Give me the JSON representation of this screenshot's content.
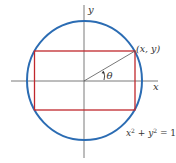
{
  "figure": {
    "labels": {
      "y_axis": "y",
      "x_axis": "x",
      "point": "(x, y)",
      "angle": "θ",
      "equation_lhs_x": "x",
      "equation_sup1": "2",
      "equation_plus": " + ",
      "equation_lhs_y": "y",
      "equation_sup2": "2",
      "equation_rhs": " = 1"
    },
    "colors": {
      "circle": "#2b6cb3",
      "rectangle": "#c0282d",
      "axes": "#6b6b6b",
      "radius": "#555555"
    },
    "geometry": {
      "center": [
        84,
        81
      ],
      "radius": 59,
      "rectangle": {
        "left": 34.5,
        "top": 51,
        "right": 135,
        "bottom": 110
      },
      "point": [
        135,
        51
      ]
    }
  }
}
